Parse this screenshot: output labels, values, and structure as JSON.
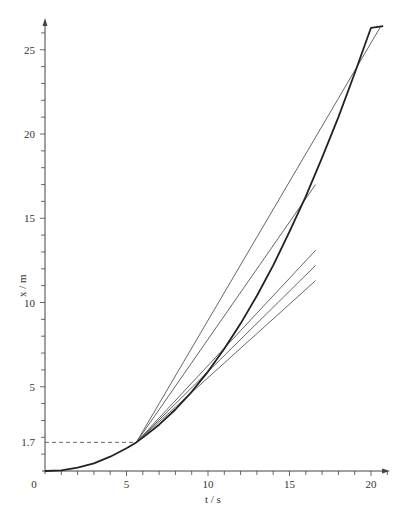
{
  "chart_data": {
    "type": "line",
    "title": "",
    "xlabel": "t / s",
    "ylabel": "x / m",
    "xlim": [
      0,
      21
    ],
    "ylim": [
      0,
      27
    ],
    "xticks_major": [
      0,
      5,
      10,
      15,
      20
    ],
    "xticks_minor_step": 1,
    "yticks_major": [
      5,
      10,
      15,
      20,
      25
    ],
    "yticks_minor_step": 1,
    "origin_label": "0",
    "special_ytick": {
      "value": 1.7,
      "label": "1.7"
    },
    "grid": false,
    "legend": null,
    "reference_line": {
      "style": "dashed",
      "from": [
        0,
        1.7
      ],
      "to": [
        5.6,
        1.7
      ]
    },
    "series": [
      {
        "name": "displacement curve",
        "style": "thick",
        "points": [
          [
            0,
            0
          ],
          [
            1,
            0.04
          ],
          [
            2,
            0.2
          ],
          [
            3,
            0.45
          ],
          [
            4,
            0.85
          ],
          [
            5,
            1.35
          ],
          [
            5.6,
            1.7
          ],
          [
            6,
            1.98
          ],
          [
            7,
            2.75
          ],
          [
            8,
            3.65
          ],
          [
            9,
            4.7
          ],
          [
            10,
            5.9
          ],
          [
            11,
            7.25
          ],
          [
            12,
            8.75
          ],
          [
            13,
            10.4
          ],
          [
            14,
            12.2
          ],
          [
            15,
            14.2
          ],
          [
            16,
            16.3
          ],
          [
            17,
            18.6
          ],
          [
            18,
            21.0
          ],
          [
            19,
            23.6
          ],
          [
            20,
            26.3
          ],
          [
            20.75,
            26.4
          ]
        ]
      },
      {
        "name": "chord to t=20.6",
        "style": "thin",
        "points": [
          [
            5.6,
            1.7
          ],
          [
            20.6,
            26.4
          ]
        ]
      },
      {
        "name": "chord to t=16.6 (upper)",
        "style": "thin",
        "points": [
          [
            5.6,
            1.7
          ],
          [
            16.6,
            17.0
          ]
        ]
      },
      {
        "name": "chord 3",
        "style": "thin",
        "points": [
          [
            5.6,
            1.7
          ],
          [
            16.6,
            13.1
          ]
        ]
      },
      {
        "name": "chord 4",
        "style": "thin",
        "points": [
          [
            5.6,
            1.7
          ],
          [
            16.6,
            12.2
          ]
        ]
      },
      {
        "name": "tangent at t=5.6",
        "style": "thin",
        "points": [
          [
            5.6,
            1.7
          ],
          [
            16.6,
            11.3
          ]
        ]
      }
    ]
  },
  "axes": {
    "x_label": "t / s",
    "y_label": "x / m",
    "origin": "0",
    "x_tick_labels": [
      "5",
      "10",
      "15",
      "20"
    ],
    "y_tick_labels": [
      "1.7",
      "5",
      "10",
      "15",
      "20",
      "25"
    ]
  },
  "colors": {
    "curve": "#222222",
    "chord": "#555555",
    "axis": "#444444",
    "dashed": "#555555"
  }
}
